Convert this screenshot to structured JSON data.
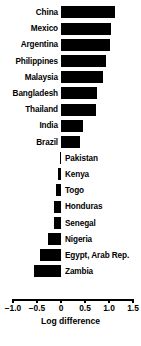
{
  "chart_data": {
    "type": "bar",
    "orientation": "horizontal",
    "title": "",
    "xlabel": "Log difference",
    "ylabel": "",
    "xlim": [
      -1.0,
      1.5
    ],
    "xticks": [
      -1.0,
      -0.5,
      0,
      0.5,
      1.0,
      1.5
    ],
    "xticklabels": [
      "−1.0",
      "−0.5",
      "0",
      "0.5",
      "1.0",
      "1.5"
    ],
    "grid": false,
    "legend": null,
    "bar_color": "#000000",
    "categories": [
      "China",
      "Mexico",
      "Argentina",
      "Philippines",
      "Malaysia",
      "Bangladesh",
      "Thailand",
      "India",
      "Brazil",
      "Pakistan",
      "Kenya",
      "Togo",
      "Honduras",
      "Senegal",
      "Nigeria",
      "Egypt, Arab Rep.",
      "Zambia"
    ],
    "values": [
      1.12,
      1.04,
      1.02,
      0.94,
      0.88,
      0.76,
      0.72,
      0.46,
      0.4,
      -0.02,
      -0.06,
      -0.11,
      -0.15,
      -0.15,
      -0.27,
      -0.44,
      -0.56
    ],
    "label_side": [
      "left",
      "left",
      "left",
      "left",
      "left",
      "left",
      "left",
      "left",
      "left",
      "right",
      "right",
      "right",
      "right",
      "right",
      "right",
      "right",
      "right"
    ]
  },
  "footnote": ""
}
